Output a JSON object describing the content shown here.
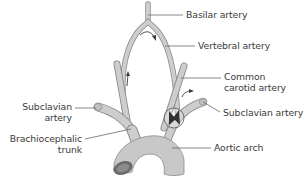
{
  "diagram": {
    "colors": {
      "vessel_fill": "#c8c8c8",
      "vessel_stroke": "#8a8a8a",
      "leader_line": "#6a6a6a",
      "text": "#3a3a3a",
      "lumen": "#6e6e6e"
    },
    "labels": {
      "basilar": "Basilar artery",
      "vertebral": "Vertebral artery",
      "common_carotid_line1": "Common",
      "common_carotid_line2": "carotid artery",
      "subclavian_right": "Subclavian artery",
      "subclavian_left_line1": "Subclavian",
      "subclavian_left_line2": "artery",
      "brachiocephalic_line1": "Brachiocephalic",
      "brachiocephalic_line2": "trunk",
      "aortic_arch": "Aortic arch"
    },
    "annotations": [
      {
        "name": "flow-arrow-basilar-curve",
        "meaning": "flow across vertebral-basilar junction"
      },
      {
        "name": "flow-arrow-vertebral-up",
        "meaning": "upward flow in right vertebral artery"
      },
      {
        "name": "flow-arrow-subclavian",
        "meaning": "flow toward left subclavian"
      },
      {
        "name": "stenosis-circle",
        "meaning": "stenosis of left subclavian artery origin"
      }
    ]
  }
}
